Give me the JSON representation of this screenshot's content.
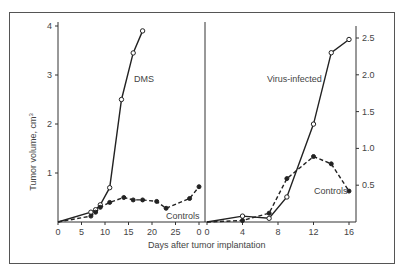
{
  "chart_data": [
    {
      "type": "line",
      "panel": "left",
      "title": "",
      "xlabel": "Days after tumor implantation",
      "ylabel": "Tumor volume, cm3",
      "xlim": [
        0,
        30
      ],
      "ylim": [
        0,
        4
      ],
      "xticks": [
        0,
        5,
        10,
        15,
        20,
        25,
        30
      ],
      "xtick_labels": [
        "0",
        "5",
        "10",
        "15",
        "20",
        "25",
        "0"
      ],
      "yticks": [
        1,
        2,
        3,
        4
      ],
      "ytick_labels": [
        "1",
        "2",
        "3",
        "4"
      ],
      "grid": false,
      "series": [
        {
          "name": "DMS",
          "style": "solid, open circles",
          "x": [
            0,
            7,
            8,
            9,
            11,
            13.5,
            16,
            18
          ],
          "y": [
            0.0,
            0.2,
            0.25,
            0.35,
            0.7,
            2.5,
            3.45,
            3.9
          ]
        },
        {
          "name": "Controls",
          "style": "dashed, filled circles",
          "x": [
            0,
            7,
            8,
            9,
            11,
            14,
            16,
            18,
            21,
            23,
            28,
            30
          ],
          "y": [
            0.0,
            0.12,
            0.2,
            0.3,
            0.4,
            0.5,
            0.45,
            0.45,
            0.42,
            0.28,
            0.48,
            0.72
          ]
        }
      ],
      "annotations": [
        "DMS",
        "Controls"
      ]
    },
    {
      "type": "line",
      "panel": "right",
      "title": "",
      "xlabel": "Days after tumor implantation",
      "ylabel": "",
      "xlim": [
        0,
        16
      ],
      "ylim": [
        0,
        2.6
      ],
      "xticks": [
        0,
        4,
        8,
        12,
        16
      ],
      "xtick_labels": [
        "0",
        "4",
        "8",
        "12",
        "16"
      ],
      "yticks": [
        0.5,
        1.0,
        1.5,
        2.0,
        2.5
      ],
      "ytick_labels": [
        "0.5",
        "1.0",
        "1.5",
        "2.0",
        "2.5"
      ],
      "y_axis_position": "right",
      "grid": false,
      "series": [
        {
          "name": "Virus-infected",
          "style": "solid, open circles",
          "x": [
            0,
            4,
            7,
            9,
            12,
            14,
            16
          ],
          "y": [
            0.0,
            0.08,
            0.05,
            0.34,
            1.33,
            2.3,
            2.48
          ]
        },
        {
          "name": "Controls",
          "style": "dashed, filled circles",
          "x": [
            0,
            4,
            7,
            9,
            12,
            14,
            16
          ],
          "y": [
            0.0,
            0.02,
            0.12,
            0.59,
            0.89,
            0.79,
            0.42
          ]
        }
      ],
      "annotations": [
        "Virus-infected",
        "Controls"
      ]
    }
  ],
  "labels": {
    "y_axis_title": "Tumor volume, cm",
    "y_axis_sup": "3",
    "x_axis_title": "Days after tumor implantation",
    "left_series_label": "DMS",
    "left_controls_label": "Controls",
    "right_series_label": "Virus-infected",
    "right_controls_label": "Controls"
  },
  "colors": {
    "line": "#222222",
    "text": "#444444",
    "frame": "#555555"
  }
}
